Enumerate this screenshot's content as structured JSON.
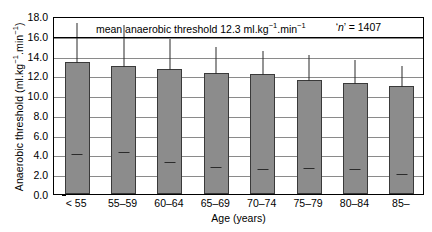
{
  "chart_data": {
    "type": "bar",
    "annotation": "‘n’ = 1407",
    "xlabel": "Age (years)",
    "ylabel": "Anaerobic threshold (ml.kg⁻¹.min⁻¹)",
    "categories": [
      "< 55",
      "55–59",
      "60–64",
      "65–69",
      "70–74",
      "75–79",
      "80–84",
      "85–"
    ],
    "values": [
      13.4,
      12.95,
      12.6,
      12.25,
      12.1,
      11.55,
      11.2,
      10.95
    ],
    "errors_upper": [
      17.2,
      17.0,
      15.6,
      14.8,
      14.4,
      13.95,
      13.5,
      12.8
    ],
    "ylim": [
      0.0,
      18.0
    ],
    "ytick_step": 2.0,
    "yticks": [
      "18.0",
      "16.0",
      "14.0",
      "12.0",
      "10.0",
      "8.0",
      "6.0",
      "4.0",
      "2.0",
      "0.0"
    ],
    "grid": true,
    "legend": "none",
    "bar_color": "#8c8c8c",
    "bar_edge_color": "#3a3a3a",
    "grid_color": "#8a8a8a",
    "axis_color": "#000000",
    "mean_value": "12.3",
    "n_value": "1407"
  },
  "ylabel_parts": {
    "main": "Anaerobic threshold (ml.kg",
    "sup1": "−1",
    "mid": ".min",
    "sup2": "−1",
    "end": ")"
  },
  "title_parts": {
    "main": "mean anaerobic threshold 12.3 ml.kg",
    "sup1": "−1",
    "mid": ".min",
    "sup2": "−1"
  },
  "n_parts": {
    "open": "‘",
    "n": "n",
    "close": "’ = 1407"
  }
}
